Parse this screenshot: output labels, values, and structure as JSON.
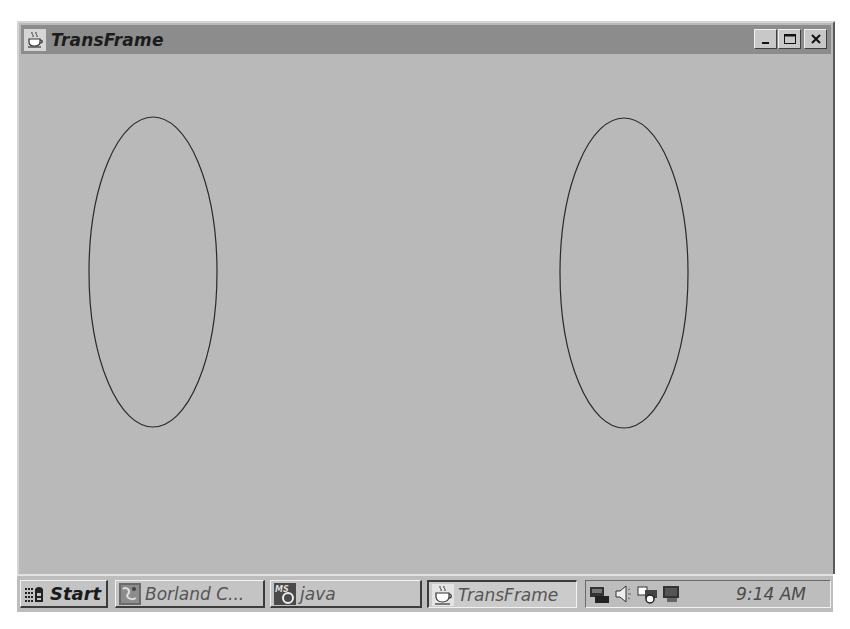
{
  "window": {
    "title": "TransFrame",
    "icon": "java-coffee-cup-icon",
    "controls": {
      "minimize": "minimize-icon",
      "maximize": "maximize-icon",
      "close": "close-icon"
    }
  },
  "canvas": {
    "background": "#b9b9b9",
    "shapes": [
      {
        "type": "ellipse",
        "cx": 134,
        "cy": 218,
        "rx": 64,
        "ry": 155,
        "stroke": "#2a2a2a"
      },
      {
        "type": "ellipse",
        "cx": 605,
        "cy": 219,
        "rx": 64,
        "ry": 155,
        "stroke": "#2a2a2a"
      }
    ]
  },
  "taskbar": {
    "start": {
      "label": "Start",
      "icon": "windows-logo-icon"
    },
    "tasks": [
      {
        "label": "Borland C...",
        "icon": "borland-app-icon",
        "active": false
      },
      {
        "label": "java",
        "icon": "ms-dos-icon",
        "active": false
      },
      {
        "label": "TransFrame",
        "icon": "java-coffee-cup-icon",
        "active": true
      }
    ],
    "tray": {
      "icons": [
        "network-icon",
        "volume-icon",
        "scheduler-icon",
        "display-icon"
      ],
      "clock": "9:14 AM"
    }
  }
}
